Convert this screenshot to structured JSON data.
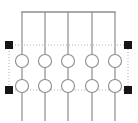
{
  "canvas": {
    "width": 138,
    "height": 123,
    "background_color": "#ffffff",
    "title": "Circuit schematic segment with selection handles"
  },
  "style": {
    "wire_color": "#8c8c8c",
    "wire_width": 1.2,
    "busbar_color": "#8c8c8c",
    "busbar_width": 1.3,
    "circle_stroke_color": "#8c8c8c",
    "circle_fill_color": "#ffffff",
    "circle_stroke_width": 1.1,
    "selection_color": "#b0b0b0",
    "selection_dash": "1,2",
    "handle_color": "#151515",
    "handle_size": 8
  },
  "busbar": {
    "label": "top-bus-bar",
    "y": 12,
    "x_start": 22,
    "x_end": 115
  },
  "branches": [
    {
      "id": "branch-1",
      "x": 22,
      "y_top": 12,
      "y_bottom": 121
    },
    {
      "id": "branch-2",
      "x": 45,
      "y_top": 12,
      "y_bottom": 121
    },
    {
      "id": "branch-3",
      "x": 68,
      "y_top": 12,
      "y_bottom": 121
    },
    {
      "id": "branch-4",
      "x": 92,
      "y_top": 12,
      "y_bottom": 121
    },
    {
      "id": "branch-5",
      "x": 115,
      "y_top": 12,
      "y_bottom": 121
    }
  ],
  "component_rows": [
    {
      "id": "component-row-upper",
      "cy": 61,
      "r": 6.5,
      "components": [
        {
          "id": "component-u1",
          "cx": 22
        },
        {
          "id": "component-u2",
          "cx": 45
        },
        {
          "id": "component-u3",
          "cx": 68
        },
        {
          "id": "component-u4",
          "cx": 92
        },
        {
          "id": "component-u5",
          "cx": 115
        }
      ]
    },
    {
      "id": "component-row-lower",
      "cy": 86,
      "r": 6.5,
      "components": [
        {
          "id": "component-l1",
          "cx": 22
        },
        {
          "id": "component-l2",
          "cx": 45
        },
        {
          "id": "component-l3",
          "cx": 68
        },
        {
          "id": "component-l4",
          "cx": 92
        },
        {
          "id": "component-l5",
          "cx": 115
        }
      ]
    }
  ],
  "selection": {
    "label": "selection-rectangle",
    "x": 9,
    "y": 45,
    "width": 119,
    "height": 45,
    "handles": [
      {
        "id": "handle-top-left",
        "cx": 9,
        "cy": 45
      },
      {
        "id": "handle-top-right",
        "cx": 128,
        "cy": 45
      },
      {
        "id": "handle-bottom-left",
        "cx": 9,
        "cy": 90
      },
      {
        "id": "handle-bottom-right",
        "cx": 128,
        "cy": 90
      }
    ]
  }
}
